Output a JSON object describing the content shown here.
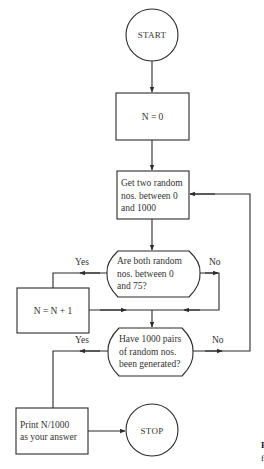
{
  "diagram": {
    "type": "flowchart",
    "nodes": {
      "start": {
        "shape": "circle",
        "label": "START"
      },
      "init": {
        "shape": "process",
        "label": "N = 0"
      },
      "generate": {
        "shape": "process",
        "lines": [
          "Get two random",
          "nos. between 0",
          "and 1000"
        ]
      },
      "check_range": {
        "shape": "decision",
        "lines": [
          "Are both random",
          "nos. between 0",
          "and 75?"
        ]
      },
      "increment": {
        "shape": "process",
        "label": "N = N + 1"
      },
      "check_count": {
        "shape": "decision",
        "lines": [
          "Have 1000 pairs",
          "of random nos.",
          "been generated?"
        ]
      },
      "output": {
        "shape": "process",
        "lines": [
          "Print N/1000",
          "as your answer"
        ]
      },
      "stop": {
        "shape": "circle",
        "label": "STOP"
      }
    },
    "edges": [
      {
        "from": "start",
        "to": "init",
        "label": ""
      },
      {
        "from": "init",
        "to": "generate",
        "label": ""
      },
      {
        "from": "generate",
        "to": "check_range",
        "label": ""
      },
      {
        "from": "check_range",
        "to": "increment",
        "label": "Yes"
      },
      {
        "from": "check_range",
        "to": "check_count",
        "label": "No"
      },
      {
        "from": "increment",
        "to": "check_count",
        "label": ""
      },
      {
        "from": "check_count",
        "to": "output",
        "label": "Yes"
      },
      {
        "from": "check_count",
        "to": "generate",
        "label": "No"
      },
      {
        "from": "output",
        "to": "stop",
        "label": ""
      }
    ],
    "branch_labels": {
      "check_range_yes": "Yes",
      "check_range_no": "No",
      "check_count_yes": "Yes",
      "check_count_no": "No"
    },
    "caption_fragment": {
      "line1": "F",
      "line2": "f"
    },
    "colors": {
      "stroke": "#2b2b2b",
      "text": "#333333",
      "background": "#ffffff"
    }
  }
}
